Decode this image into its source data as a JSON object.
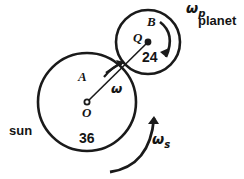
{
  "diagram": {
    "background_color": "#ffffff",
    "stroke_color": "#1a1a1a",
    "text_color": "#141414"
  },
  "sun_gear": {
    "name_label": "sun",
    "center_label": "O",
    "point_label": "A",
    "tooth_count_label": "36",
    "angular_velocity_label": "ω",
    "angular_velocity_sub": "s",
    "center_x": 87,
    "center_y": 102,
    "radius": 49
  },
  "planet_gear": {
    "name_label": "planet",
    "center_label": "Q",
    "point_label": "B",
    "tooth_count_label": "24",
    "angular_velocity_label": "ω",
    "angular_velocity_sub": "p",
    "center_x": 148,
    "center_y": 42,
    "radius": 32
  },
  "arm": {
    "from_label": "O",
    "to_label": "Q",
    "angular_velocity_label": "ω"
  },
  "icons": {
    "sun_rotation_arrow": "curved-arrow-counterclockwise-icon",
    "planet_rotation_arrow": "curved-arrow-clockwise-icon",
    "arm_rotation_arrow": "short-arrow-icon",
    "tick_mark": "tick-mark-icon"
  }
}
